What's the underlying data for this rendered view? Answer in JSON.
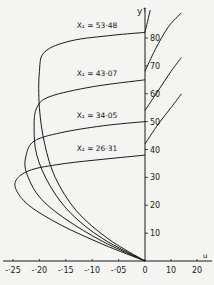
{
  "chart_data": {
    "type": "line",
    "title": "",
    "xlabel": "u",
    "ylabel": "y",
    "xlim": [
      -0.27,
      0.22
    ],
    "ylim": [
      0,
      90
    ],
    "grid": false,
    "x_ticks_negative": [
      "-·25",
      "-·20",
      "-·15",
      "-·10",
      "-·05"
    ],
    "x_tick_values_negative": [
      -0.25,
      -0.2,
      -0.15,
      -0.1,
      -0.05
    ],
    "x_ticks_positive": [
      "0",
      "10",
      "20"
    ],
    "x_tick_values_positive": [
      0,
      10,
      20
    ],
    "y_ticks": [
      "10",
      "20",
      "30",
      "40",
      "50",
      "60",
      "70",
      "80"
    ],
    "y_tick_values": [
      10,
      20,
      30,
      40,
      50,
      60,
      70,
      80
    ],
    "series": [
      {
        "name": "X1 = 26·31",
        "label": "X₁ = 26·31",
        "x1": 26.31,
        "top_y": 38,
        "points": [
          [
            0,
            0
          ],
          [
            -0.08,
            6
          ],
          [
            -0.16,
            13
          ],
          [
            -0.22,
            20
          ],
          [
            -0.245,
            26
          ],
          [
            -0.24,
            30
          ],
          [
            -0.21,
            33
          ],
          [
            -0.15,
            35
          ],
          [
            -0.08,
            36.5
          ],
          [
            0,
            38
          ]
        ],
        "positive_branch": [
          [
            0,
            42
          ],
          [
            5,
            49
          ],
          [
            10,
            55
          ],
          [
            14,
            60
          ]
        ]
      },
      {
        "name": "X1 = 34·05",
        "label": "X₁ = 34·05",
        "x1": 34.05,
        "top_y": 50,
        "points": [
          [
            0,
            0
          ],
          [
            -0.08,
            7
          ],
          [
            -0.15,
            15
          ],
          [
            -0.2,
            23
          ],
          [
            -0.225,
            32
          ],
          [
            -0.225,
            38
          ],
          [
            -0.21,
            43
          ],
          [
            -0.16,
            46
          ],
          [
            -0.08,
            48.5
          ],
          [
            0,
            50
          ]
        ],
        "positive_branch": [
          [
            0,
            54
          ],
          [
            5,
            61
          ],
          [
            10,
            68
          ],
          [
            14,
            73
          ]
        ]
      },
      {
        "name": "X1 = 43·07",
        "label": "X₁ = 43·07",
        "x1": 43.07,
        "top_y": 65,
        "points": [
          [
            0,
            0
          ],
          [
            -0.08,
            8
          ],
          [
            -0.14,
            17
          ],
          [
            -0.18,
            27
          ],
          [
            -0.205,
            38
          ],
          [
            -0.21,
            48
          ],
          [
            -0.205,
            55
          ],
          [
            -0.18,
            59
          ],
          [
            -0.1,
            62.5
          ],
          [
            0,
            65
          ]
        ],
        "positive_branch": [
          [
            0,
            68
          ],
          [
            4,
            76
          ],
          [
            9,
            84
          ],
          [
            14,
            89
          ]
        ]
      },
      {
        "name": "X1 = 53·48",
        "label": "X₁ = 53·48",
        "x1": 53.48,
        "top_y": 82,
        "points": [
          [
            0,
            0
          ],
          [
            -0.07,
            8
          ],
          [
            -0.13,
            18
          ],
          [
            -0.17,
            30
          ],
          [
            -0.19,
            42
          ],
          [
            -0.2,
            55
          ],
          [
            -0.2,
            68
          ],
          [
            -0.19,
            75
          ],
          [
            -0.14,
            79
          ],
          [
            -0.06,
            81
          ],
          [
            0,
            82
          ]
        ],
        "positive_branch": [
          [
            0,
            82
          ],
          [
            1,
            86
          ],
          [
            2,
            90
          ]
        ]
      }
    ]
  }
}
